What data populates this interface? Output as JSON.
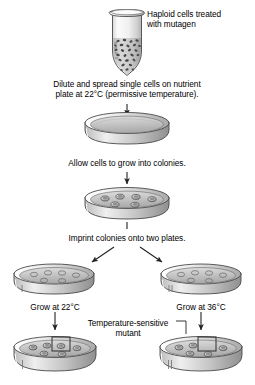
{
  "figure": {
    "background": "#ffffff",
    "width": 255,
    "height": 385
  },
  "labels": {
    "haploid": "Haploid cells treated\nwith mutagen",
    "dilute": "Dilute and spread single cells on nutrient\nplate at 22°C (permissive temperature).",
    "allow": "Allow cells to grow into colonies.",
    "imprint": "Imprint colonies onto two plates.",
    "grow_left": "Grow at 22°C",
    "grow_right": "Grow at 36°C",
    "ts_mutant": "Temperature-sensitive\nmutant"
  },
  "colors": {
    "outline": "#3b3b3b",
    "dish_rim_light": "#f2f2f2",
    "dish_rim_mid": "#cfcfcf",
    "dish_rim_dark": "#9a9a9a",
    "agar_light": "#d8d8d8",
    "agar_mid": "#c2c2c2",
    "agar_dark": "#a8a8a8",
    "colony_fill": "#9d9d9d",
    "colony_fill_light": "#d5d5d5",
    "tube_glass": "#f4f4f4",
    "cells": "#4a4a4a",
    "highlight_box": "#2e2e2e"
  },
  "elements": {
    "tube": {
      "name": "microcentrifuge-tube",
      "contents": "mutagen-treated haploid cells",
      "cell_count": 34
    },
    "plate_1": {
      "name": "nutrient-plate-spread",
      "colonies": []
    },
    "plate_2": {
      "name": "nutrient-plate-colonies",
      "colonies": [
        {
          "cx": 105,
          "cy": 198
        },
        {
          "cx": 124,
          "cy": 195
        },
        {
          "cx": 143,
          "cy": 197
        },
        {
          "cx": 158,
          "cy": 201
        },
        {
          "cx": 117,
          "cy": 207
        },
        {
          "cx": 138,
          "cy": 208
        }
      ]
    },
    "plate_left_imprint": {
      "name": "replica-plate-22c",
      "colonies": [
        {
          "cx": 33,
          "cy": 274
        },
        {
          "cx": 47,
          "cy": 272
        },
        {
          "cx": 61,
          "cy": 273
        },
        {
          "cx": 75,
          "cy": 276
        },
        {
          "cx": 44,
          "cy": 281
        },
        {
          "cx": 62,
          "cy": 282
        }
      ]
    },
    "plate_right_imprint": {
      "name": "replica-plate-36c",
      "colonies": [
        {
          "cx": 178,
          "cy": 274
        },
        {
          "cx": 192,
          "cy": 272
        },
        {
          "cx": 206,
          "cy": 273
        },
        {
          "cx": 220,
          "cy": 276
        },
        {
          "cx": 189,
          "cy": 281
        },
        {
          "cx": 207,
          "cy": 282
        }
      ]
    },
    "plate_left_final": {
      "name": "grown-plate-22c",
      "colonies": [
        {
          "cx": 29,
          "cy": 348
        },
        {
          "cx": 44,
          "cy": 346
        },
        {
          "cx": 58,
          "cy": 347
        },
        {
          "cx": 73,
          "cy": 349
        },
        {
          "cx": 41,
          "cy": 356
        },
        {
          "cx": 60,
          "cy": 357
        }
      ],
      "highlight_box": {
        "x": 50,
        "y": 336,
        "w": 18,
        "h": 17
      },
      "highlight_has_colony": true
    },
    "plate_right_final": {
      "name": "grown-plate-36c",
      "colonies": [
        {
          "cx": 174,
          "cy": 348
        },
        {
          "cx": 189,
          "cy": 346
        },
        {
          "cx": 218,
          "cy": 349
        },
        {
          "cx": 186,
          "cy": 356
        },
        {
          "cx": 205,
          "cy": 357
        }
      ],
      "highlight_box": {
        "x": 195,
        "y": 336,
        "w": 18,
        "h": 17
      },
      "highlight_has_colony": false
    }
  },
  "arrows": [
    {
      "name": "arrow-tube-to-plate1",
      "from": [
        127,
        72
      ],
      "to": [
        127,
        112
      ]
    },
    {
      "name": "arrow-plate1-to-plate2",
      "from": [
        127,
        150
      ],
      "to": [
        127,
        182
      ]
    },
    {
      "name": "arrow-plate2-to-branch",
      "from": [
        127,
        224
      ],
      "to": [
        127,
        232
      ]
    },
    {
      "name": "arrow-branch-left",
      "from": [
        113,
        246
      ],
      "to": [
        88,
        264
      ]
    },
    {
      "name": "arrow-branch-right",
      "from": [
        141,
        246
      ],
      "to": [
        166,
        264
      ]
    },
    {
      "name": "arrow-left-grow",
      "from": [
        55,
        311
      ],
      "to": [
        55,
        331
      ]
    },
    {
      "name": "arrow-right-grow",
      "from": [
        201,
        311
      ],
      "to": [
        201,
        331
      ]
    },
    {
      "name": "leader-ts-mutant",
      "from": [
        178,
        322
      ],
      "to": [
        199,
        334
      ]
    }
  ]
}
